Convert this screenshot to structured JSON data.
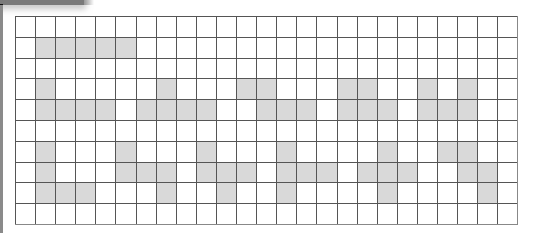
{
  "grid": {
    "rows": 10,
    "cols": 25,
    "colors": {
      "filled": "#d9d9d9",
      "empty": "#ffffff",
      "line": "#555555"
    },
    "filled_cells": [
      [],
      [
        1,
        2,
        3,
        4,
        5
      ],
      [],
      [
        1,
        7,
        11,
        12,
        16,
        17,
        20,
        22
      ],
      [
        1,
        2,
        3,
        4,
        6,
        7,
        8,
        9,
        12,
        13,
        14,
        16,
        17,
        18,
        20,
        21,
        22
      ],
      [],
      [
        1,
        5,
        9,
        13,
        18,
        21,
        22
      ],
      [
        1,
        5,
        6,
        7,
        9,
        10,
        11,
        13,
        14,
        15,
        17,
        18,
        19,
        22,
        23
      ],
      [
        1,
        2,
        3,
        7,
        10,
        13,
        18,
        23
      ],
      []
    ]
  }
}
